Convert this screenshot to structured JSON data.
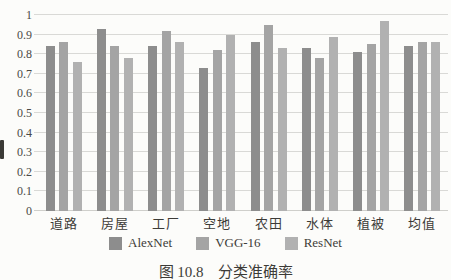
{
  "figure": {
    "caption_label": "图 10.8",
    "caption_title": "分类准确率"
  },
  "chart_data": {
    "type": "bar",
    "title": "",
    "xlabel": "",
    "ylabel": "",
    "categories": [
      "道路",
      "房屋",
      "工厂",
      "空地",
      "农田",
      "水体",
      "植被",
      "均值"
    ],
    "series": [
      {
        "name": "AlexNet",
        "color": "#8d8d8d",
        "values": [
          0.84,
          0.93,
          0.84,
          0.73,
          0.86,
          0.83,
          0.81,
          0.84
        ]
      },
      {
        "name": "VGG-16",
        "color": "#a4a4a4",
        "values": [
          0.86,
          0.84,
          0.92,
          0.82,
          0.95,
          0.78,
          0.85,
          0.86
        ]
      },
      {
        "name": "ResNet",
        "color": "#b1b1b1",
        "values": [
          0.76,
          0.78,
          0.86,
          0.9,
          0.83,
          0.89,
          0.97,
          0.86
        ]
      }
    ],
    "ylim": [
      0,
      1
    ],
    "ytick_step": 0.1,
    "ytick_labels": [
      "0",
      "0.1",
      "0.2",
      "0.3",
      "0.4",
      "0.5",
      "0.6",
      "0.7",
      "0.8",
      "0.9",
      "1"
    ],
    "grid": true,
    "gridline_color": "#d9d9d6",
    "legend_position": "bottom",
    "background_color": "#fcfcfa",
    "text_color": "#3c3b37"
  }
}
